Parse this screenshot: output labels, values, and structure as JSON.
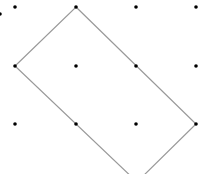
{
  "diagram": {
    "grid_dots": [
      {
        "x": 0,
        "y": 14
      },
      {
        "x": 15,
        "y": 7
      },
      {
        "x": 76,
        "y": 7
      },
      {
        "x": 136,
        "y": 7
      },
      {
        "x": 196,
        "y": 7
      },
      {
        "x": 15,
        "y": 66
      },
      {
        "x": 76,
        "y": 66
      },
      {
        "x": 136,
        "y": 66
      },
      {
        "x": 196,
        "y": 66
      },
      {
        "x": 15,
        "y": 124
      },
      {
        "x": 76,
        "y": 124
      },
      {
        "x": 136,
        "y": 124
      },
      {
        "x": 196,
        "y": 124
      }
    ],
    "rectangle_vertices": [
      {
        "x": 76,
        "y": 7
      },
      {
        "x": 196,
        "y": 124
      },
      {
        "x": 137,
        "y": 182
      },
      {
        "x": 15,
        "y": 66
      }
    ],
    "colors": {
      "dot": "#000000",
      "line": "#999999",
      "background": "#ffffff"
    }
  }
}
